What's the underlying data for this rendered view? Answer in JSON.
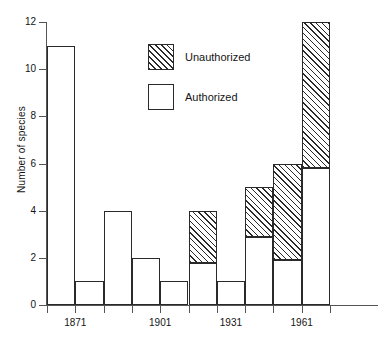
{
  "chart_data": {
    "type": "bar",
    "subtype": "stacked",
    "title": "",
    "xlabel": "",
    "ylabel": "Number of species",
    "ylim": [
      0,
      12
    ],
    "ytick_values": [
      0,
      2,
      4,
      6,
      8,
      10,
      12
    ],
    "ytick_labels": [
      "0",
      "2",
      "4",
      "6",
      "8",
      "10",
      "12"
    ],
    "xtick_labels": [
      "1871",
      "1901",
      "1931",
      "1961"
    ],
    "xtick_label_positions": [
      1,
      4,
      6.5,
      9
    ],
    "grid": false,
    "legend_position": "upper-center",
    "categories": [
      "b1",
      "b2",
      "b3",
      "b4",
      "b5",
      "b6",
      "b7",
      "b8",
      "b9",
      "b10"
    ],
    "series": [
      {
        "name": "Authorized",
        "fill": "white",
        "values": [
          11,
          1,
          4,
          2,
          1,
          1.8,
          1,
          2.9,
          1.9,
          5.8
        ]
      },
      {
        "name": "Unauthorized",
        "fill": "hatched",
        "values": [
          0,
          0,
          0,
          0,
          0,
          2.2,
          0,
          2.1,
          4.1,
          6.2
        ]
      }
    ],
    "totals": [
      11,
      1,
      4,
      2,
      1,
      4,
      1,
      5,
      6,
      12
    ],
    "bars": [
      {
        "index": 0,
        "authorized": 11,
        "unauthorized": 0,
        "total": 11
      },
      {
        "index": 1,
        "authorized": 1,
        "unauthorized": 0,
        "total": 1
      },
      {
        "index": 2,
        "authorized": 4,
        "unauthorized": 0,
        "total": 4
      },
      {
        "index": 3,
        "authorized": 2,
        "unauthorized": 0,
        "total": 2
      },
      {
        "index": 4,
        "authorized": 1,
        "unauthorized": 0,
        "total": 1
      },
      {
        "index": 5,
        "authorized": 1.8,
        "unauthorized": 2.2,
        "total": 4
      },
      {
        "index": 6,
        "authorized": 1,
        "unauthorized": 0,
        "total": 1
      },
      {
        "index": 7,
        "authorized": 2.9,
        "unauthorized": 2.1,
        "total": 5
      },
      {
        "index": 8,
        "authorized": 1.9,
        "unauthorized": 4.1,
        "total": 6
      },
      {
        "index": 9,
        "authorized": 5.8,
        "unauthorized": 6.2,
        "total": 12
      }
    ]
  },
  "legend": {
    "items": [
      {
        "label": "Unauthorized",
        "fill": "hatched"
      },
      {
        "label": "Authorized",
        "fill": "white"
      }
    ]
  },
  "colors": {
    "ink": "#2a2a2a",
    "axis": "#555555",
    "background": "#ffffff"
  }
}
